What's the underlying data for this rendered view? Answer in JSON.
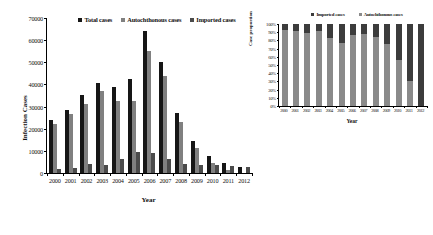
{
  "chart_data": [
    {
      "id": "main",
      "type": "bar",
      "title": "",
      "xlabel": "Year",
      "ylabel": "Infection Cases",
      "ylim": [
        0,
        70000
      ],
      "ytick_values": [
        0,
        10000,
        20000,
        30000,
        40000,
        50000,
        60000,
        70000
      ],
      "ytick_labels": [
        "0",
        "10000",
        "20000",
        "30000",
        "40000",
        "50000",
        "60000",
        "70000"
      ],
      "grid": false,
      "legend_position": "top-center",
      "categories": [
        "2000",
        "2001",
        "2002",
        "2003",
        "2004",
        "2005",
        "2006",
        "2007",
        "2008",
        "2009",
        "2010",
        "2011",
        "2012"
      ],
      "series": [
        {
          "name": "Total cases",
          "color": "#161616",
          "values": [
            24000,
            28500,
            35200,
            40600,
            39000,
            42300,
            64200,
            50100,
            26900,
            14400,
            7900,
            4500,
            2800
          ]
        },
        {
          "name": "Autochthonous cases",
          "color": "#808080",
          "values": [
            22200,
            26500,
            31300,
            37200,
            32600,
            32700,
            55300,
            44000,
            22900,
            11200,
            4300,
            1300,
            0
          ]
        },
        {
          "name": "Imported cases",
          "color": "#4b4b4b",
          "values": [
            1700,
            2400,
            3900,
            3500,
            6500,
            9600,
            8900,
            6200,
            4200,
            3600,
            3400,
            3000,
            2600
          ]
        }
      ]
    },
    {
      "id": "inset",
      "type": "bar",
      "stacked": true,
      "stack_mode": "percent",
      "title": "",
      "xlabel": "Year",
      "ylabel": "Case proportion",
      "ylim": [
        0,
        100
      ],
      "ytick_values": [
        0,
        10,
        20,
        30,
        40,
        50,
        60,
        70,
        80,
        90,
        100
      ],
      "ytick_labels": [
        "0%",
        "10%",
        "20%",
        "30%",
        "40%",
        "50%",
        "60%",
        "70%",
        "80%",
        "90%",
        "100%"
      ],
      "grid": false,
      "legend_position": "top-center",
      "categories": [
        "2000",
        "2001",
        "2002",
        "2003",
        "2004",
        "2005",
        "2006",
        "2007",
        "2008",
        "2009",
        "2010",
        "2011",
        "2012"
      ],
      "series": [
        {
          "name": "Imported cases",
          "color": "#3c3c3c",
          "values": [
            7,
            8,
            11,
            9,
            17,
            23,
            14,
            12,
            16,
            24,
            44,
            70,
            100
          ]
        },
        {
          "name": "Autochthonous cases",
          "color": "#8a8a8a",
          "values": [
            93,
            92,
            89,
            91,
            83,
            77,
            86,
            88,
            84,
            76,
            56,
            30,
            0
          ]
        }
      ]
    }
  ],
  "main": {
    "ylabel": "Infection Cases",
    "xlabel": "Year",
    "legend": [
      {
        "label": "Total cases"
      },
      {
        "label": "Autochthonous cases"
      },
      {
        "label": "Imported cases"
      }
    ]
  },
  "inset": {
    "ylabel": "Case proportion",
    "xlabel": "Year",
    "legend": [
      {
        "label": "Imported cases"
      },
      {
        "label": "Autochthonous cases"
      }
    ]
  }
}
